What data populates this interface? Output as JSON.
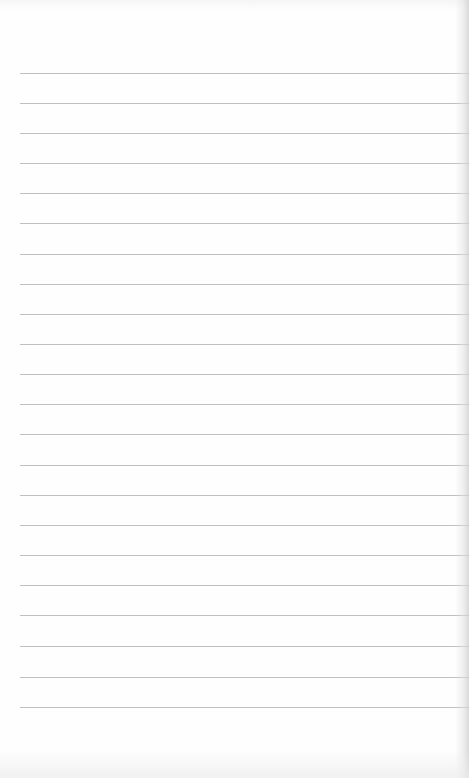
{
  "document": {
    "type": "blank ruled notebook page",
    "background_color": "#fefefe",
    "rule_color": "#b4b4b4",
    "rules": {
      "count": 22,
      "left_x": 20,
      "positions_y": [
        73,
        103,
        133,
        163,
        193,
        223,
        254,
        284,
        314,
        344,
        374,
        404,
        434,
        465,
        495,
        525,
        555,
        585,
        615,
        646,
        677,
        707
      ]
    }
  }
}
